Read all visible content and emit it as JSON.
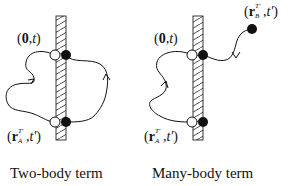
{
  "diagrams": [
    {
      "id": "two-body",
      "caption": "Two-body term",
      "top_label": {
        "open": "(",
        "bold": "0",
        "sep": ",",
        "italic": "t",
        "close": ")"
      },
      "bottom_label": {
        "open": "(",
        "bold": "r",
        "sup": "T'",
        "sub": "A",
        "sep": ",",
        "italic": "t'",
        "close": ")"
      }
    },
    {
      "id": "many-body",
      "caption": "Many-body term",
      "top_label": {
        "open": "(",
        "bold": "0",
        "sep": ",",
        "italic": "t",
        "close": ")"
      },
      "bottom_label": {
        "open": "(",
        "bold": "r",
        "sup": "T'",
        "sub": "A",
        "sep": ",",
        "italic": "t'",
        "close": ")"
      },
      "external_label": {
        "open": "(",
        "bold": "r",
        "sup": "T'",
        "sub": "B",
        "sep": ",",
        "italic": "t'",
        "close": ")"
      }
    }
  ],
  "colors": {
    "line": "#111111",
    "open_fill": "#ffffff",
    "filled": "#111111",
    "background": "#ffffff"
  }
}
